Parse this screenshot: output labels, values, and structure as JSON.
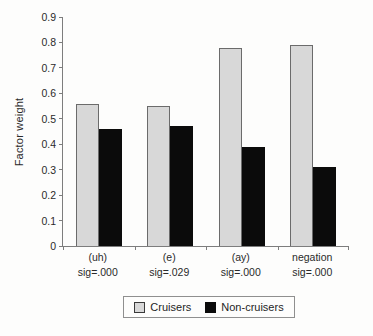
{
  "figure": {
    "background": "#fdfdfc"
  },
  "chart_data": {
    "type": "bar",
    "title": "",
    "xlabel": "",
    "ylabel": "Factor weight",
    "ylim": [
      0,
      0.9
    ],
    "ytick_step": 0.1,
    "yticks": [
      0,
      0.1,
      0.2,
      0.3,
      0.4,
      0.5,
      0.6,
      0.7,
      0.8,
      0.9
    ],
    "grid": false,
    "categories": [
      "(uh)",
      "(e)",
      "(ay)",
      "negation"
    ],
    "category_sublabels": [
      "sig=.000",
      "sig=.029",
      "sig=.000",
      "sig=.000"
    ],
    "series": [
      {
        "name": "Cruisers",
        "color": "#d8d8d8",
        "border": "#6b6b6b",
        "values": [
          0.56,
          0.55,
          0.78,
          0.79
        ]
      },
      {
        "name": "Non-cruisers",
        "color": "#0b0b0b",
        "border": "#0b0b0b",
        "values": [
          0.46,
          0.47,
          0.39,
          0.31
        ]
      }
    ],
    "legend_position": "bottom",
    "axis_color": "#7d7d7d",
    "text_color": "#2a2a2a"
  }
}
